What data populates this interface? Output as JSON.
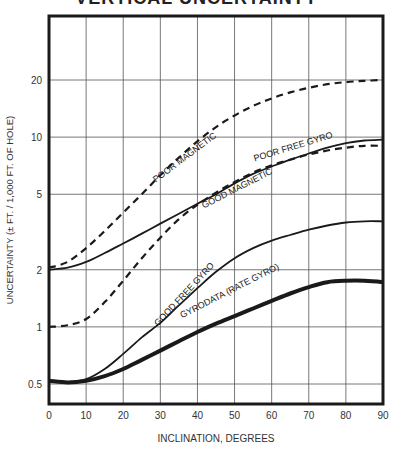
{
  "chart_data": {
    "type": "line",
    "title": "VERTICAL UNCERTAINTY",
    "xlabel": "INCLINATION, DEGREES",
    "ylabel": "UNCERTAINTY (± FT. / 1,000 FT. OF HOLE)",
    "yscale": "log",
    "xlim": [
      0,
      90
    ],
    "ylim": [
      0.42,
      40
    ],
    "grid": true,
    "x_ticks": [
      0,
      10,
      20,
      30,
      40,
      50,
      60,
      70,
      80,
      90
    ],
    "y_ticks": [
      0.5,
      1,
      2,
      5,
      10,
      20
    ],
    "x": [
      0,
      5,
      10,
      15,
      20,
      25,
      30,
      35,
      40,
      45,
      50,
      55,
      60,
      65,
      70,
      75,
      80,
      85,
      90
    ],
    "series": [
      {
        "name": "POOR MAGNETIC",
        "style": "dashed",
        "width": 2.2,
        "values": [
          2.05,
          2.2,
          2.6,
          3.2,
          4.0,
          5.0,
          6.3,
          7.8,
          9.5,
          11.3,
          13.0,
          14.6,
          16.0,
          17.2,
          18.2,
          19.0,
          19.5,
          19.8,
          20.0
        ]
      },
      {
        "name": "POOR FREE GYRO",
        "style": "solid",
        "width": 1.8,
        "values": [
          2.0,
          2.05,
          2.2,
          2.45,
          2.75,
          3.1,
          3.5,
          3.95,
          4.45,
          5.0,
          5.7,
          6.4,
          7.0,
          7.6,
          8.2,
          8.8,
          9.3,
          9.6,
          9.7
        ]
      },
      {
        "name": "GOOD MAGNETIC",
        "style": "dashed",
        "width": 2.2,
        "values": [
          1.0,
          1.02,
          1.1,
          1.35,
          1.75,
          2.3,
          2.95,
          3.7,
          4.4,
          5.1,
          5.8,
          6.5,
          7.1,
          7.6,
          8.1,
          8.5,
          8.8,
          9.0,
          9.0
        ]
      },
      {
        "name": "GOOD FREE GYRO",
        "style": "solid",
        "width": 1.8,
        "values": [
          0.52,
          0.51,
          0.53,
          0.6,
          0.72,
          0.88,
          1.05,
          1.3,
          1.6,
          1.95,
          2.3,
          2.6,
          2.85,
          3.05,
          3.25,
          3.42,
          3.55,
          3.6,
          3.6
        ]
      },
      {
        "name": "GYRODATA (RATE GYRO)",
        "style": "solid",
        "width": 4,
        "values": [
          0.52,
          0.51,
          0.52,
          0.55,
          0.6,
          0.67,
          0.75,
          0.84,
          0.94,
          1.04,
          1.14,
          1.25,
          1.37,
          1.5,
          1.62,
          1.72,
          1.75,
          1.75,
          1.72
        ]
      }
    ],
    "annotations": [
      {
        "text": "POOR MAGNETIC",
        "x": 37,
        "y": 7.6,
        "angle": -37
      },
      {
        "text": "POOR FREE GYRO",
        "x": 66,
        "y": 8.6,
        "angle": -17
      },
      {
        "text": "GOOD MAGNETIC",
        "x": 51,
        "y": 5.2,
        "angle": -27
      },
      {
        "text": "GOOD FREE GYRO",
        "x": 37,
        "y": 1.45,
        "angle": -47
      },
      {
        "text": "GYRODATA (RATE GYRO)",
        "x": 49,
        "y": 1.5,
        "angle": -27
      }
    ]
  }
}
